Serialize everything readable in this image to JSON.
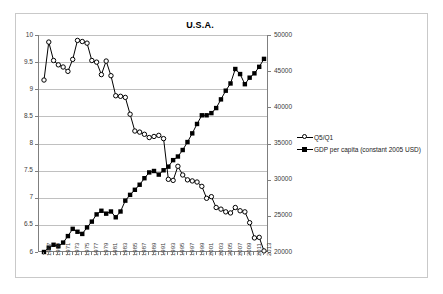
{
  "figure": {
    "title": "U.S.A."
  },
  "legend": {
    "items": [
      {
        "label": "Q5/Q1",
        "marker": "open-circle",
        "color": "#000000"
      },
      {
        "label": "GDP per capita (constant 2005 USD)",
        "marker": "filled-square",
        "color": "#000000"
      }
    ]
  },
  "axes": {
    "left_ticks": [
      "6",
      "6.5",
      "7",
      "7.5",
      "8",
      "8.5",
      "9",
      "9.5",
      "10"
    ],
    "right_ticks": [
      "20000",
      "25000",
      "30000",
      "35000",
      "40000",
      "45000",
      "50000"
    ],
    "x_ticks": [
      "1967",
      "1969",
      "1971",
      "1973",
      "1975",
      "1977",
      "1979",
      "1981",
      "1983",
      "1985",
      "1987",
      "1989",
      "1991",
      "1993",
      "1995",
      "1997",
      "1999",
      "2001",
      "2003",
      "2005",
      "2007",
      "2009",
      "2011",
      "2013"
    ]
  },
  "chart_data": {
    "type": "line",
    "title": "U.S.A.",
    "xlabel": "",
    "ylabel": "",
    "grid": true,
    "legend_position": "right",
    "x": [
      1967,
      1968,
      1969,
      1970,
      1971,
      1972,
      1973,
      1974,
      1975,
      1976,
      1977,
      1978,
      1979,
      1980,
      1981,
      1982,
      1983,
      1984,
      1985,
      1986,
      1987,
      1988,
      1989,
      1990,
      1991,
      1992,
      1993,
      1994,
      1995,
      1996,
      1997,
      1998,
      1999,
      2000,
      2001,
      2002,
      2003,
      2004,
      2005,
      2006,
      2007,
      2008,
      2009,
      2010,
      2011,
      2012,
      2013
    ],
    "series": [
      {
        "name": "Q5/Q1",
        "axis": "left",
        "marker": "open-circle",
        "color": "#000000",
        "ylim": [
          6,
          10
        ],
        "values": [
          9.17,
          9.87,
          9.53,
          9.45,
          9.41,
          9.33,
          9.55,
          9.9,
          9.88,
          9.85,
          9.53,
          9.5,
          9.27,
          9.52,
          9.25,
          8.88,
          8.87,
          8.85,
          8.54,
          8.23,
          8.21,
          8.17,
          8.11,
          8.13,
          8.15,
          8.09,
          7.34,
          7.32,
          7.58,
          7.42,
          7.33,
          7.31,
          7.29,
          7.21,
          6.99,
          7.02,
          6.82,
          6.79,
          6.74,
          6.72,
          6.82,
          6.76,
          6.74,
          6.54,
          6.26,
          6.27,
          6.02
        ]
      },
      {
        "name": "GDP per capita (constant 2005 USD)",
        "axis": "right",
        "marker": "filled-square",
        "color": "#000000",
        "ylim": [
          20000,
          50000
        ],
        "values": [
          20000,
          20600,
          21000,
          20800,
          21300,
          22200,
          23200,
          22800,
          22500,
          23400,
          24200,
          25200,
          25700,
          25300,
          25600,
          24800,
          25600,
          27100,
          27900,
          28600,
          29300,
          30200,
          31000,
          31200,
          30700,
          31300,
          31800,
          32700,
          33200,
          34100,
          35200,
          36400,
          37700,
          38900,
          38900,
          39200,
          39900,
          41100,
          42300,
          43300,
          45300,
          44600,
          43200,
          44100,
          44700,
          45600,
          46700
        ]
      }
    ]
  }
}
